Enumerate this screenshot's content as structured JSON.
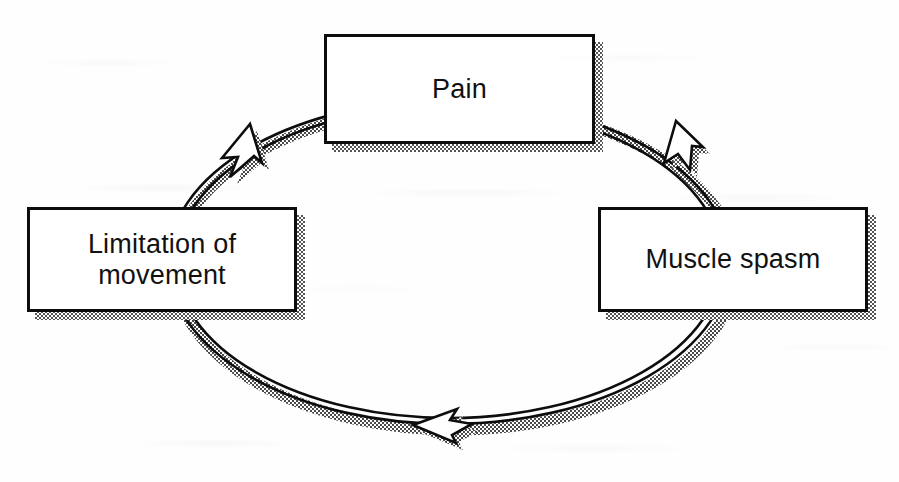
{
  "diagram": {
    "type": "cycle-diagram",
    "background_color": "#fefefe",
    "stroke_color": "#0d0d0d",
    "shadow_color": "#808080",
    "box_fill": "#ffffff",
    "nodes": [
      {
        "id": "pain",
        "label": "Pain",
        "position": "top",
        "x": 324,
        "y": 34,
        "w": 271,
        "h": 110
      },
      {
        "id": "muscle-spasm",
        "label": "Muscle spasm",
        "position": "right",
        "x": 598,
        "y": 207,
        "w": 270,
        "h": 105
      },
      {
        "id": "limitation-of-movement",
        "label": "Limitation of\nmovement",
        "position": "left",
        "x": 27,
        "y": 207,
        "w": 270,
        "h": 105
      }
    ],
    "edges": [
      {
        "id": "pain-to-muscle-spasm",
        "from": "pain",
        "to": "muscle-spasm",
        "arrow": "top-right",
        "direction": "clockwise"
      },
      {
        "id": "muscle-spasm-to-limitation",
        "from": "muscle-spasm",
        "to": "limitation-of-movement",
        "arrow": "bottom",
        "direction": "clockwise"
      },
      {
        "id": "limitation-to-pain",
        "from": "limitation-of-movement",
        "to": "pain",
        "arrow": "top-left",
        "direction": "clockwise"
      }
    ]
  }
}
